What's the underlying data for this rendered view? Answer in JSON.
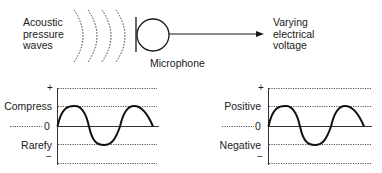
{
  "top": {
    "source_label": [
      "Acoustic",
      "pressure",
      "waves"
    ],
    "device_label": "Microphone",
    "output_label": [
      "Varying",
      "electrical",
      "voltage"
    ]
  },
  "plots": [
    {
      "name": "acoustic-pressure",
      "plus": "+",
      "upper": "Compress",
      "zero": "0",
      "lower": "Rarefy",
      "minus": "−"
    },
    {
      "name": "electrical-voltage",
      "plus": "+",
      "upper": "Positive",
      "zero": "0",
      "lower": "Negative",
      "minus": "−"
    }
  ],
  "colors": {
    "ink": "#1a1a1a",
    "dotted": "#555555"
  }
}
